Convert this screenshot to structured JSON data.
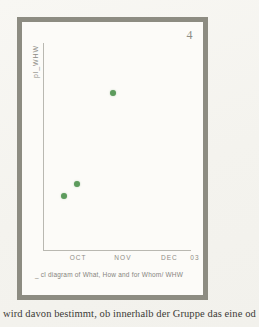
{
  "page": {
    "number": "4",
    "body_text": "wird davon bestimmt, ob innerhalb der Gruppe das eine od"
  },
  "figure": {
    "caption": "_ cl diagram of What, How and for Whom/ WHW",
    "frame_color": "#8d8c82",
    "background_color": "#fcfbf8"
  },
  "chart_data": {
    "type": "scatter",
    "title": "",
    "xlabel": "",
    "ylabel": "pl_WHW",
    "grid": false,
    "legend": null,
    "marker_color": "#5d9b5d",
    "categories": [
      "OCT",
      "NOV",
      "DEC",
      "03"
    ],
    "xtick_labels": [
      "OCT",
      "NOV",
      "DEC",
      "03"
    ],
    "xtick_positions_pct": [
      22,
      50,
      79,
      95
    ],
    "points": [
      {
        "x_pct": 14,
        "y_pct": 74
      },
      {
        "x_pct": 23,
        "y_pct": 68
      },
      {
        "x_pct": 47,
        "y_pct": 24
      }
    ],
    "xlim": [
      0,
      100
    ],
    "ylim": [
      0,
      100
    ]
  }
}
